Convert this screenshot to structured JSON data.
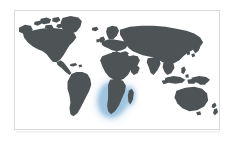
{
  "figure": {
    "kind": "world-map-thumbnail",
    "width_px": 235,
    "height_px": 142,
    "projection": "equirectangular",
    "frame": {
      "border_color": "#d8d8d8",
      "border_width_px": 1,
      "left_px": 14,
      "top_px": 10,
      "width_px": 206,
      "height_px": 120
    },
    "colors": {
      "ocean": "#ffffff",
      "land": "#4e5356",
      "highlight_glow": "#9fc4e0",
      "highlight_glow_outer": "#cfe2f1",
      "background": "#ffffff"
    }
  },
  "map": {
    "ocean_label": "ocean",
    "land_label": "landmass",
    "continents": [
      {
        "name": "North America",
        "label": "north-america"
      },
      {
        "name": "South America",
        "label": "south-america"
      },
      {
        "name": "Europe",
        "label": "europe"
      },
      {
        "name": "Africa",
        "label": "africa"
      },
      {
        "name": "Asia",
        "label": "asia"
      },
      {
        "name": "Australia",
        "label": "australia"
      },
      {
        "name": "Greenland",
        "label": "greenland"
      },
      {
        "name": "Madagascar",
        "label": "madagascar"
      },
      {
        "name": "New Zealand",
        "label": "new-zealand"
      },
      {
        "name": "Indonesia",
        "label": "indonesia"
      },
      {
        "name": "Japan",
        "label": "japan"
      },
      {
        "name": "British Isles",
        "label": "british-isles"
      }
    ],
    "highlight": {
      "region_name": "Southern Africa",
      "glow_color": "#9fc4e0",
      "glow_outer_color": "#cfe2f1",
      "countries": [
        "South Africa",
        "Namibia",
        "Botswana",
        "Zimbabwe",
        "Mozambique",
        "Madagascar"
      ]
    }
  }
}
